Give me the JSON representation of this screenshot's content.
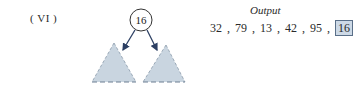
{
  "step_label": "( VI )",
  "tree": {
    "root": {
      "value": "16"
    },
    "subtrees": [
      "left-subtree",
      "right-subtree"
    ],
    "colors": {
      "subtree_fill": "#c9d5e0",
      "subtree_stroke": "#6d7f93",
      "arrow": "#2c3f63",
      "node_stroke": "#333333"
    }
  },
  "output": {
    "title": "Output",
    "values": [
      "32",
      "79",
      "13",
      "42",
      "95",
      "16"
    ],
    "highlighted_index": 5,
    "separator": ","
  }
}
